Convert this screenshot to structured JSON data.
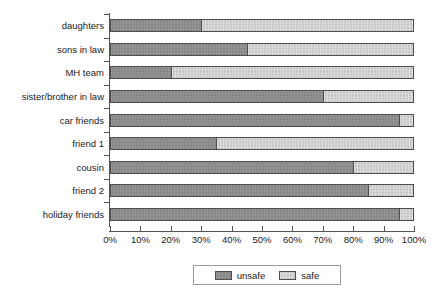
{
  "chart_data": {
    "type": "bar",
    "subtype": "stacked-horizontal-100-percent",
    "title": "",
    "subtitle": "",
    "xlabel": "",
    "ylabel": "",
    "xlim": [
      0,
      100
    ],
    "xticks": [
      0,
      10,
      20,
      30,
      40,
      50,
      60,
      70,
      80,
      90,
      100
    ],
    "xtick_labels": [
      "0%",
      "10%",
      "20%",
      "30%",
      "40%",
      "50%",
      "60%",
      "70%",
      "80%",
      "90%",
      "100%"
    ],
    "grid": false,
    "legend_position": "bottom-center",
    "categories": [
      "daughters",
      "sons in law",
      "MH team",
      "sister/brother in law",
      "car friends",
      "friend 1",
      "cousin",
      "friend 2",
      "holiday friends"
    ],
    "series": [
      {
        "name": "unsafe",
        "color": "#8c8c8c",
        "values": [
          30,
          45,
          20,
          70,
          95,
          35,
          80,
          85,
          95
        ]
      },
      {
        "name": "safe",
        "color": "#cfcfcf",
        "values": [
          70,
          55,
          80,
          30,
          5,
          65,
          20,
          15,
          5
        ]
      }
    ]
  },
  "legend": {
    "entries": [
      {
        "label": "unsafe",
        "color": "#8c8c8c"
      },
      {
        "label": "safe",
        "color": "#cfcfcf"
      }
    ]
  }
}
